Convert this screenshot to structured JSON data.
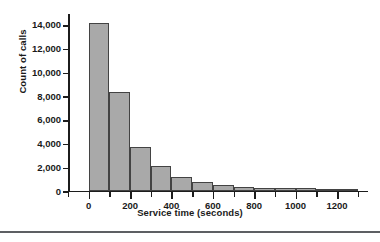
{
  "chart_data": {
    "type": "bar",
    "title": "",
    "subtitle": "",
    "xlabel": "Service time (seconds)",
    "ylabel": "Count of calls",
    "xlim": [
      -100,
      1350
    ],
    "ylim": [
      0,
      15000
    ],
    "grid": false,
    "legend": null,
    "bin_width": 100,
    "bar_color": "#a9a9a9",
    "bar_edge_color": "#434343",
    "axis_color": "#1c1c1c",
    "x_tick_values": [
      0,
      200,
      400,
      600,
      800,
      1000,
      1200
    ],
    "x_tick_labels": [
      "0",
      "200",
      "400",
      "600",
      "800",
      "1000",
      "1200"
    ],
    "x_minor_tick_values": [
      -100,
      100,
      300,
      500,
      700,
      900,
      1100,
      1300
    ],
    "y_tick_values": [
      0,
      2000,
      4000,
      6000,
      8000,
      10000,
      12000,
      14000
    ],
    "y_tick_labels": [
      "0",
      "2,000",
      "4,000",
      "6,000",
      "8,000",
      "10,000",
      "12,000",
      "14,000"
    ],
    "bin_edges": [
      0,
      100,
      200,
      300,
      400,
      500,
      600,
      700,
      800,
      900,
      1000,
      1100,
      1200,
      1300
    ],
    "categories": [
      "0-100",
      "100-200",
      "200-300",
      "300-400",
      "400-500",
      "500-600",
      "600-700",
      "700-800",
      "800-900",
      "900-1000",
      "1000-1100",
      "1100-1200",
      "1200-1300"
    ],
    "values": [
      14100,
      8300,
      3650,
      2050,
      1150,
      700,
      500,
      300,
      250,
      250,
      200,
      60,
      40
    ]
  }
}
